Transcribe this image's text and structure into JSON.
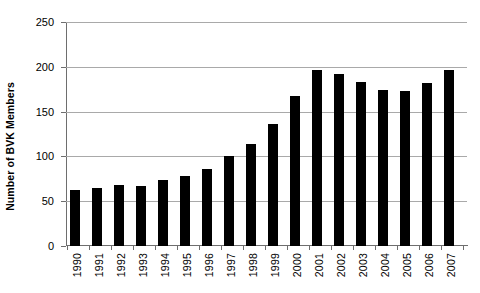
{
  "chart_data": {
    "type": "bar",
    "title": "",
    "xlabel": "",
    "ylabel": "Number of BVK Members",
    "categories": [
      "1990",
      "1991",
      "1992",
      "1993",
      "1994",
      "1995",
      "1996",
      "1997",
      "1998",
      "1999",
      "2000",
      "2001",
      "2002",
      "2003",
      "2004",
      "2005",
      "2006",
      "2007"
    ],
    "values": [
      62,
      65,
      68,
      67,
      74,
      78,
      86,
      100,
      114,
      136,
      167,
      196,
      192,
      183,
      174,
      173,
      182,
      197
    ],
    "ylim": [
      0,
      250
    ],
    "yticks": [
      0,
      50,
      100,
      150,
      200,
      250
    ],
    "ytick_labels": [
      "0",
      "50",
      "100",
      "150",
      "200",
      "250"
    ],
    "grid": "horizontal",
    "legend": "none",
    "bar_color": "#000000",
    "grid_color": "#a9a9a9",
    "axis_color": "#6e6e6e"
  }
}
